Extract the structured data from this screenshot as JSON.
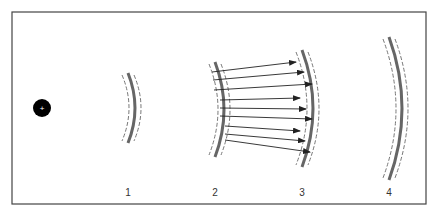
{
  "diagram": {
    "source": {
      "cx": 42,
      "cy": 108,
      "r": 9,
      "symbol": "+"
    },
    "colors": {
      "frame": "#444444",
      "main_wave": "#666666",
      "dashed": "#777777",
      "arrow": "#222222",
      "source": "#000000"
    },
    "wavefronts": [
      {
        "id": "1",
        "label": "1",
        "x": 128,
        "top": 73,
        "bottom": 143,
        "bulge": 7
      },
      {
        "id": "2",
        "label": "2",
        "x": 215,
        "top": 62,
        "bottom": 157,
        "bulge": 9
      },
      {
        "id": "3",
        "label": "3",
        "x": 302,
        "top": 50,
        "bottom": 167,
        "bulge": 11
      },
      {
        "id": "4",
        "label": "4",
        "x": 389,
        "top": 37,
        "bottom": 180,
        "bulge": 13
      }
    ],
    "label_y": 196,
    "arrows": [
      {
        "x1": 212,
        "y1": 72,
        "x2": 296,
        "y2": 62
      },
      {
        "x1": 213,
        "y1": 80,
        "x2": 304,
        "y2": 72
      },
      {
        "x1": 214,
        "y1": 90,
        "x2": 312,
        "y2": 84
      },
      {
        "x1": 220,
        "y1": 100,
        "x2": 300,
        "y2": 98
      },
      {
        "x1": 220,
        "y1": 108,
        "x2": 306,
        "y2": 109
      },
      {
        "x1": 220,
        "y1": 116,
        "x2": 312,
        "y2": 119
      },
      {
        "x1": 225,
        "y1": 126,
        "x2": 300,
        "y2": 131
      },
      {
        "x1": 225,
        "y1": 134,
        "x2": 305,
        "y2": 141
      },
      {
        "x1": 225,
        "y1": 140,
        "x2": 310,
        "y2": 152
      }
    ]
  }
}
